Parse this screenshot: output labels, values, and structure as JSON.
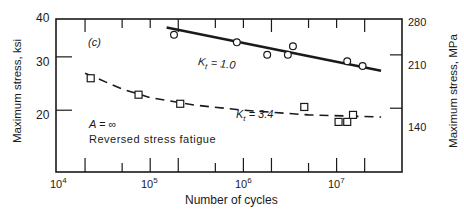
{
  "chart_data": {
    "type": "scatter",
    "title": "",
    "panel_label": "(c)",
    "xlabel": "Number of cycles",
    "ylabel": "Maximum stress, ksi",
    "ylabel_right": "Maximum stress, MPa",
    "xscale": "log",
    "yscale": "log",
    "xlim": [
      10000,
      40000000
    ],
    "ylim": [
      16,
      40
    ],
    "x_tick_labels": [
      "10^4",
      "10^5",
      "10^6",
      "10^7"
    ],
    "y_tick_labels": [
      "20",
      "30",
      "40"
    ],
    "y_right_tick_labels": [
      "140",
      "210",
      "280"
    ],
    "grid": false,
    "annotations": [
      "A = ∞",
      "Reversed stress fatigue",
      "Kt = 1.0",
      "Kt = 3.4"
    ],
    "series": [
      {
        "name": "Kt = 1.0",
        "marker": "circle",
        "line": "solid",
        "points": [
          {
            "x": 180000,
            "y": 35.5
          },
          {
            "x": 850000,
            "y": 33.5
          },
          {
            "x": 1800000,
            "y": 30.5
          },
          {
            "x": 3000000,
            "y": 30.5
          },
          {
            "x": 3400000,
            "y": 32.5
          },
          {
            "x": 13000000,
            "y": 29.0
          },
          {
            "x": 19000000,
            "y": 28.0
          }
        ],
        "fit_line": [
          {
            "x": 150000,
            "y": 37.5
          },
          {
            "x": 30000000,
            "y": 27.0
          }
        ]
      },
      {
        "name": "Kt = 3.4",
        "marker": "square",
        "line": "dashed",
        "points": [
          {
            "x": 23000,
            "y": 25.5
          },
          {
            "x": 75000,
            "y": 22.5
          },
          {
            "x": 210000,
            "y": 21.0
          },
          {
            "x": 4500000,
            "y": 20.5
          },
          {
            "x": 10500000,
            "y": 18.3
          },
          {
            "x": 13000000,
            "y": 18.3
          },
          {
            "x": 15000000,
            "y": 19.3
          }
        ],
        "fit_curve": [
          {
            "x": 20000,
            "y": 26.5
          },
          {
            "x": 50000,
            "y": 23.5
          },
          {
            "x": 100000,
            "y": 22.0
          },
          {
            "x": 300000,
            "y": 20.8
          },
          {
            "x": 1000000,
            "y": 20.0
          },
          {
            "x": 5000000,
            "y": 19.3
          },
          {
            "x": 30000000,
            "y": 19.0
          }
        ]
      }
    ]
  },
  "labels": {
    "panel": "(c)",
    "kt1": "Kt = 1.0",
    "kt1_sym": "K",
    "kt1_sub": "t",
    "kt1_val": "= 1.0",
    "kt2_sym": "K",
    "kt2_sub": "t",
    "kt2_val": "= 3.4",
    "a_inf": "A = ∞",
    "reversed": "Reversed stress fatigue",
    "xlabel": "Number of cycles",
    "ylabel_left": "Maximum stress, ksi",
    "ylabel_right": "Maximum stress, MPa",
    "yticks_left": [
      "40",
      "30",
      "20"
    ],
    "yticks_right": [
      "280",
      "210",
      "140"
    ],
    "xticks": [
      {
        "base": "10",
        "exp": "4"
      },
      {
        "base": "10",
        "exp": "5"
      },
      {
        "base": "10",
        "exp": "6"
      },
      {
        "base": "10",
        "exp": "7"
      }
    ]
  }
}
